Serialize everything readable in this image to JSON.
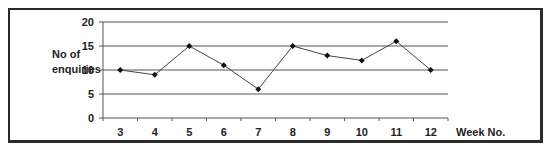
{
  "chart_data": {
    "type": "line",
    "title": "",
    "ylabel": "No of enquiries",
    "ylabel_lines": [
      "No of",
      "enquiries"
    ],
    "xlabel": "Week No.",
    "categories": [
      "3",
      "4",
      "5",
      "6",
      "7",
      "8",
      "9",
      "10",
      "11",
      "12"
    ],
    "x": [
      3,
      4,
      5,
      6,
      7,
      8,
      9,
      10,
      11,
      12
    ],
    "values": [
      10,
      9,
      15,
      11,
      6,
      15,
      13,
      12,
      16,
      10
    ],
    "ylim": [
      0,
      20
    ],
    "yticks": [
      0,
      5,
      10,
      15,
      20
    ],
    "grid": true,
    "legend": null,
    "marker": "diamond",
    "colors": {
      "line": "#444444",
      "grid": "#555555",
      "marker": "#111111"
    }
  }
}
